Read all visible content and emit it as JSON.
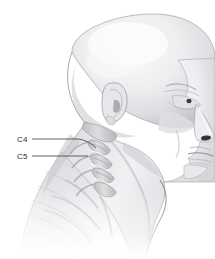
{
  "figure": {
    "kind": "anatomical-illustration",
    "overlay": "cervical spine visible through soft tissue",
    "background_color": "#ffffff",
    "skin_base_color": "#e9e9ea",
    "skin_shadow_color": "#bcbcc0",
    "skin_highlight_color": "#f7f7f8",
    "bone_color": "#d2d2d6",
    "bone_shadow_color": "#a9a9ae",
    "outline_color": "#8f8f95",
    "label_color": "#2b2b2b",
    "leader_line_color": "#3a3a3a"
  },
  "callouts": [
    {
      "id": "c4",
      "label": "C4",
      "label_x": 17,
      "label_y": 142,
      "leader": {
        "x1": 32,
        "y1": 139,
        "x2": 78,
        "y2": 139,
        "x3": 96,
        "y3": 148
      }
    },
    {
      "id": "c5",
      "label": "C5",
      "label_x": 17,
      "label_y": 159,
      "leader": {
        "x1": 32,
        "y1": 156,
        "x2": 88,
        "y2": 156,
        "x3": 88,
        "y3": 156
      }
    }
  ],
  "anatomy_features": [
    {
      "name": "cranium-vault",
      "label": "cranium"
    },
    {
      "name": "forehead",
      "label": "forehead"
    },
    {
      "name": "brow-ridge",
      "label": "brow ridge"
    },
    {
      "name": "eye",
      "label": "eye"
    },
    {
      "name": "nose",
      "label": "nose"
    },
    {
      "name": "nostril",
      "label": "nostril"
    },
    {
      "name": "lips",
      "label": "lips"
    },
    {
      "name": "chin",
      "label": "chin"
    },
    {
      "name": "ear",
      "label": "ear"
    },
    {
      "name": "jawline",
      "label": "jawline"
    },
    {
      "name": "neck",
      "label": "neck"
    },
    {
      "name": "throat",
      "label": "throat"
    },
    {
      "name": "shoulder",
      "label": "shoulder"
    },
    {
      "name": "cervical-vertebrae",
      "label": "cervical vertebrae"
    },
    {
      "name": "trapezius",
      "label": "trapezius"
    }
  ]
}
